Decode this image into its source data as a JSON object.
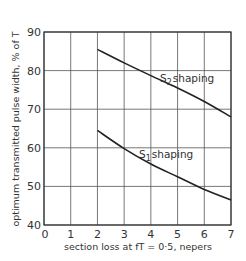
{
  "chart_data": {
    "type": "line",
    "title": "",
    "xlabel": "section loss at fT = 0·5, nepers",
    "ylabel": "optimum transmitted pulse width, % of T",
    "xlim": [
      0,
      7
    ],
    "ylim": [
      40,
      90
    ],
    "x_ticks": [
      "0",
      "1",
      "2",
      "3",
      "4",
      "5",
      "6",
      "7"
    ],
    "y_ticks": [
      "40",
      "50",
      "60",
      "70",
      "80",
      "90"
    ],
    "grid": true,
    "legend": "none (curves labelled directly)",
    "x": [
      2,
      3,
      4,
      5,
      6,
      7
    ],
    "series": [
      {
        "name": "S2 shaping",
        "label_main": "S",
        "label_sub": "2",
        "label_rest": "shaping",
        "values": [
          85.5,
          82,
          78.7,
          75.5,
          72,
          68
        ]
      },
      {
        "name": "S1 shaping",
        "label_main": "S",
        "label_sub": "1",
        "label_rest": "shaping",
        "values": [
          64.5,
          59.8,
          55.8,
          52.5,
          49.2,
          46.5
        ]
      }
    ]
  }
}
